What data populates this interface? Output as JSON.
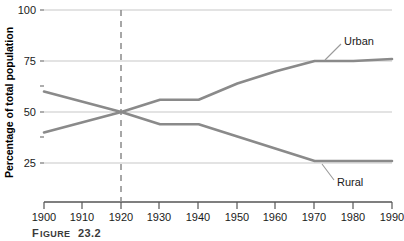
{
  "figure": {
    "caption_main": "F",
    "caption_rest": "IGURE",
    "caption_number": "23.2",
    "caption_full": "FIGURE 23.2"
  },
  "colors": {
    "line": "#8a8a8a",
    "gridline": "#c8c8c8",
    "axis": "#555555",
    "text": "#1a1a1a",
    "caption": "#3a3a3a",
    "background": "#ffffff"
  },
  "chart_data": {
    "type": "line",
    "title": "",
    "subtitle": "",
    "xlabel": "",
    "ylabel": "Percentage of total population",
    "x": [
      1900,
      1910,
      1920,
      1930,
      1940,
      1950,
      1960,
      1970,
      1980,
      1990
    ],
    "categories": [
      "1900",
      "1910",
      "1920",
      "1930",
      "1940",
      "1950",
      "1960",
      "1970",
      "1980",
      "1990"
    ],
    "xticklabels": [
      "1900",
      "1910",
      "1920",
      "1930",
      "1940",
      "1950",
      "1960",
      "1970",
      "1980",
      "1990"
    ],
    "yticklabels": [
      "25",
      "50",
      "75",
      "100"
    ],
    "yticks": [
      25,
      50,
      75,
      100
    ],
    "xlim": [
      1900,
      1990
    ],
    "ylim": [
      0,
      100
    ],
    "grid": "horizontal",
    "legend": "inline-annotations",
    "series": [
      {
        "name": "Urban",
        "label": "Urban",
        "values": [
          40,
          45,
          50,
          56,
          56,
          64,
          70,
          75,
          75,
          76
        ]
      },
      {
        "name": "Rural",
        "label": "Rural",
        "values": [
          60,
          55,
          50,
          44,
          44,
          38,
          32,
          26,
          26,
          26
        ]
      }
    ],
    "annotations": [
      {
        "name": "reference-line-1920",
        "type": "vline",
        "x": 1920,
        "style": "dashed",
        "note": "1920 crossover: urban and rural both 50%"
      },
      {
        "name": "urban-label",
        "type": "text",
        "text": "Urban"
      },
      {
        "name": "rural-label",
        "type": "text",
        "text": "Rural"
      }
    ]
  }
}
